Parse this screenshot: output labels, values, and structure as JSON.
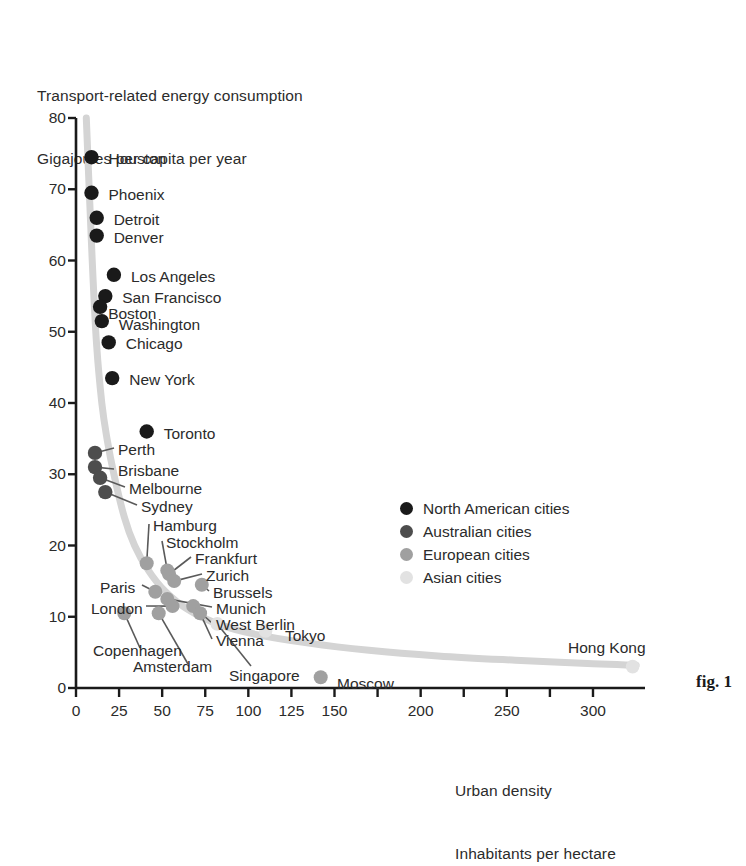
{
  "figure": {
    "caption": "fig. 1",
    "y_axis_title_line1": "Transport-related energy consumption",
    "y_axis_title_line2": "Gigajoules per capita per year",
    "x_axis_title_line1": "Urban density",
    "x_axis_title_line2": "Inhabitants per hectare"
  },
  "colors": {
    "north_american": "#1a1a1a",
    "australian": "#4d4d4d",
    "european": "#a0a0a0",
    "asian": "#e2e2e2",
    "trend_line": "#d4d4d4",
    "axis": "#1a1a1a",
    "text": "#2b2b2b"
  },
  "chart_data": {
    "type": "scatter",
    "xlabel": "Urban density — Inhabitants per hectare",
    "ylabel": "Transport-related energy consumption — Gigajoules per capita per year",
    "xlim": [
      0,
      330
    ],
    "ylim": [
      0,
      80
    ],
    "xticks": [
      0,
      25,
      50,
      75,
      100,
      125,
      150,
      175,
      200,
      225,
      250,
      275,
      300
    ],
    "xtick_labels": [
      "0",
      "25",
      "50",
      "75",
      "100",
      "125",
      "150",
      "",
      "200",
      "",
      "250",
      "",
      "300"
    ],
    "yticks": [
      0,
      10,
      20,
      30,
      40,
      50,
      60,
      70,
      80
    ],
    "ytick_labels": [
      "0",
      "10",
      "20",
      "30",
      "40",
      "50",
      "60",
      "70",
      "80"
    ],
    "grid": false,
    "legend_position": "middle-right",
    "series": [
      {
        "name": "North American cities",
        "color": "#1a1a1a",
        "points": [
          {
            "label": "Houston",
            "x": 9,
            "y": 74.5,
            "label_dx": 17,
            "label_dy": -6
          },
          {
            "label": "Phoenix",
            "x": 9,
            "y": 69.5,
            "label_dx": 17,
            "label_dy": -6
          },
          {
            "label": "Detroit",
            "x": 12,
            "y": 66.0,
            "label_dx": 17,
            "label_dy": -6
          },
          {
            "label": "Denver",
            "x": 12,
            "y": 63.5,
            "label_dx": 17,
            "label_dy": -6
          },
          {
            "label": "Los Angeles",
            "x": 22,
            "y": 58.0,
            "label_dx": 17,
            "label_dy": -6
          },
          {
            "label": "San Francisco",
            "x": 17,
            "y": 55.0,
            "label_dx": 17,
            "label_dy": -6
          },
          {
            "label": "Boston",
            "x": 14,
            "y": 53.5,
            "label_dx": 8,
            "label_dy": -1
          },
          {
            "label": "Washington",
            "x": 15,
            "y": 51.5,
            "label_dx": 17,
            "label_dy": -4
          },
          {
            "label": "Chicago",
            "x": 19,
            "y": 48.5,
            "label_dx": 17,
            "label_dy": -6
          },
          {
            "label": "New York",
            "x": 21,
            "y": 43.5,
            "label_dx": 17,
            "label_dy": -6
          },
          {
            "label": "Toronto",
            "x": 41,
            "y": 36.0,
            "label_dx": 17,
            "label_dy": -6
          }
        ]
      },
      {
        "name": "Australian cities",
        "color": "#4d4d4d",
        "points": [
          {
            "label": "Perth",
            "x": 11,
            "y": 33.0,
            "leader_to_x": 64,
            "leader_to_y": 126
          },
          {
            "label": "Brisbane",
            "x": 11,
            "y": 31.0,
            "leader_to_x": 64,
            "leader_to_y": 147
          },
          {
            "label": "Melbourne",
            "x": 14,
            "y": 29.5,
            "leader_to_x": 77,
            "leader_to_y": 166
          },
          {
            "label": "Sydney",
            "x": 17,
            "y": 27.5,
            "leader_to_x": 88,
            "leader_to_y": 186
          }
        ]
      },
      {
        "name": "European cities",
        "color": "#a0a0a0",
        "points": [
          {
            "label": "Hamburg",
            "x": 41,
            "y": 17.5
          },
          {
            "label": "Stockholm",
            "x": 53,
            "y": 16.5
          },
          {
            "label": "Frankfurt",
            "x": 54,
            "y": 16.0
          },
          {
            "label": "Zurich",
            "x": 57,
            "y": 15.0
          },
          {
            "label": "Brussels",
            "x": 73,
            "y": 14.5
          },
          {
            "label": "Paris",
            "x": 46,
            "y": 13.5
          },
          {
            "label": "Munich",
            "x": 53,
            "y": 12.5
          },
          {
            "label": "London",
            "x": 56,
            "y": 11.5
          },
          {
            "label": "West Berlin",
            "x": 68,
            "y": 11.5
          },
          {
            "label": "Vienna",
            "x": 72,
            "y": 10.5
          },
          {
            "label": "Copenhagen",
            "x": 28,
            "y": 10.5
          },
          {
            "label": "Amsterdam",
            "x": 48,
            "y": 10.5
          },
          {
            "label": "Moscow",
            "x": 142,
            "y": 1.5
          }
        ]
      },
      {
        "name": "Asian cities",
        "color": "#e2e2e2",
        "points": [
          {
            "label": "Singapore",
            "x": 82,
            "y": 9.0
          },
          {
            "label": "Tokyo",
            "x": 110,
            "y": 8.0
          },
          {
            "label": "Hong Kong",
            "x": 323,
            "y": 3.0
          }
        ]
      }
    ],
    "trend_line": {
      "description": "Hyperbolic decay fit through all cities",
      "points": [
        [
          6,
          80
        ],
        [
          8,
          68
        ],
        [
          10,
          57
        ],
        [
          12,
          48
        ],
        [
          15,
          40
        ],
        [
          18,
          35
        ],
        [
          22,
          30
        ],
        [
          28,
          24
        ],
        [
          34,
          20
        ],
        [
          42,
          16.5
        ],
        [
          52,
          13.5
        ],
        [
          65,
          11
        ],
        [
          82,
          9
        ],
        [
          105,
          7.5
        ],
        [
          135,
          6.3
        ],
        [
          170,
          5.3
        ],
        [
          210,
          4.5
        ],
        [
          255,
          3.9
        ],
        [
          300,
          3.4
        ],
        [
          325,
          3.2
        ]
      ]
    },
    "legend": [
      {
        "label": "North American cities",
        "color": "#1a1a1a"
      },
      {
        "label": "Australian cities",
        "color": "#4d4d4d"
      },
      {
        "label": "European cities",
        "color": "#a0a0a0"
      },
      {
        "label": "Asian cities",
        "color": "#e2e2e2"
      }
    ]
  },
  "annotations": {
    "label_positions": [
      {
        "name": "Perth",
        "left": 118,
        "top": 442
      },
      {
        "name": "Brisbane",
        "left": 118,
        "top": 463
      },
      {
        "name": "Melbourne",
        "left": 129,
        "top": 481
      },
      {
        "name": "Sydney",
        "left": 141,
        "top": 499
      },
      {
        "name": "Hamburg",
        "left": 153,
        "top": 518
      },
      {
        "name": "Stockholm",
        "left": 166,
        "top": 535
      },
      {
        "name": "Frankfurt",
        "left": 195,
        "top": 551
      },
      {
        "name": "Zurich",
        "left": 206,
        "top": 568
      },
      {
        "name": "Brussels",
        "left": 213,
        "top": 585
      },
      {
        "name": "Paris",
        "left": 100,
        "top": 580
      },
      {
        "name": "Munich",
        "left": 216,
        "top": 601
      },
      {
        "name": "London",
        "left": 91,
        "top": 601
      },
      {
        "name": "West Berlin",
        "left": 216,
        "top": 617
      },
      {
        "name": "Vienna",
        "left": 216,
        "top": 633
      },
      {
        "name": "Copenhagen",
        "left": 93,
        "top": 643
      },
      {
        "name": "Amsterdam",
        "left": 133,
        "top": 659
      },
      {
        "name": "Singapore",
        "left": 229,
        "top": 668
      },
      {
        "name": "Tokyo",
        "left": 285,
        "top": 628
      },
      {
        "name": "Moscow",
        "left": 337,
        "top": 676
      },
      {
        "name": "Hong Kong",
        "left": 568,
        "top": 640
      }
    ]
  }
}
